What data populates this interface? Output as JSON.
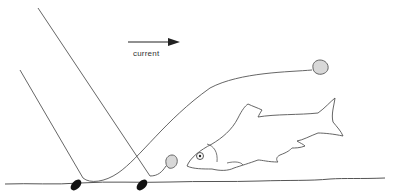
{
  "diagram": {
    "type": "illustration",
    "labels": {
      "current": "current"
    },
    "elements": {
      "lines": 2,
      "weights": 2,
      "baits": 2,
      "fish": 1,
      "arrow_direction": "right"
    },
    "colors": {
      "line": "#555555",
      "weight": "#111111",
      "bait_fill": "#d8d8d8",
      "fish_outline": "#555555",
      "background": "#ffffff"
    }
  }
}
